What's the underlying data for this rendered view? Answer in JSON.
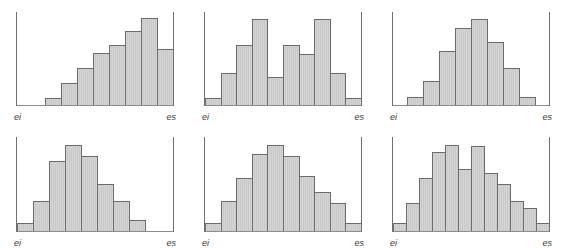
{
  "figure": {
    "type": "histogram-grid",
    "rows": 2,
    "columns": 3,
    "background_color": "#ffffff",
    "bar_fill_color": "#cfcfcf",
    "bar_border_color": "#6b6b6b",
    "axis_color": "#6f6f6f"
  },
  "axis_labels": {
    "left": "ei",
    "right": "es"
  },
  "chart_data": [
    {
      "type": "bar",
      "title": "",
      "subtitle": "",
      "xlabel": "",
      "ylabel": "",
      "panel": 1,
      "position": "top-left",
      "shape": "left-skewed increasing",
      "grid": false,
      "legend": "none",
      "xticks": [
        "ei",
        "es"
      ],
      "categories": [
        "1",
        "2",
        "3",
        "4",
        "5",
        "6",
        "7",
        "8",
        "9"
      ],
      "values": [
        0,
        0,
        8,
        24,
        40,
        56,
        64,
        80,
        94,
        60
      ],
      "ylim": [
        0,
        100
      ]
    },
    {
      "type": "bar",
      "title": "",
      "subtitle": "",
      "xlabel": "",
      "ylabel": "",
      "panel": 2,
      "position": "top-middle",
      "shape": "bimodal",
      "grid": false,
      "legend": "none",
      "xticks": [
        "ei",
        "es"
      ],
      "categories": [
        "1",
        "2",
        "3",
        "4",
        "5",
        "6",
        "7",
        "8",
        "9",
        "10"
      ],
      "values": [
        8,
        34,
        64,
        92,
        30,
        64,
        55,
        92,
        34,
        8
      ],
      "ylim": [
        0,
        100
      ]
    },
    {
      "type": "bar",
      "title": "",
      "subtitle": "",
      "xlabel": "",
      "ylabel": "",
      "panel": 3,
      "position": "top-right",
      "shape": "symmetric bell",
      "grid": false,
      "legend": "none",
      "xticks": [
        "ei",
        "es"
      ],
      "categories": [
        "1",
        "2",
        "3",
        "4",
        "5",
        "6",
        "7",
        "8"
      ],
      "values": [
        0,
        9,
        26,
        58,
        83,
        92,
        68,
        40,
        9,
        0
      ],
      "ylim": [
        0,
        100
      ]
    },
    {
      "type": "bar",
      "title": "",
      "subtitle": "",
      "xlabel": "",
      "ylabel": "",
      "panel": 4,
      "position": "bottom-left",
      "shape": "right-skewed",
      "grid": false,
      "legend": "none",
      "xticks": [
        "ei",
        "es"
      ],
      "categories": [
        "1",
        "2",
        "3",
        "4",
        "5",
        "6",
        "7",
        "8"
      ],
      "values": [
        8,
        32,
        74,
        92,
        80,
        50,
        32,
        12,
        0,
        0
      ],
      "ylim": [
        0,
        100
      ]
    },
    {
      "type": "bar",
      "title": "",
      "subtitle": "",
      "xlabel": "",
      "ylabel": "",
      "panel": 5,
      "position": "bottom-middle",
      "shape": "symmetric bell",
      "grid": false,
      "legend": "none",
      "xticks": [
        "ei",
        "es"
      ],
      "categories": [
        "1",
        "2",
        "3",
        "4",
        "5",
        "6",
        "7",
        "8",
        "9",
        "10"
      ],
      "values": [
        9,
        32,
        56,
        82,
        92,
        80,
        58,
        42,
        30,
        9
      ],
      "ylim": [
        0,
        100
      ]
    },
    {
      "type": "bar",
      "title": "",
      "subtitle": "",
      "xlabel": "",
      "ylabel": "",
      "panel": 6,
      "position": "bottom-right",
      "shape": "broad irregular",
      "grid": false,
      "legend": "none",
      "xticks": [
        "ei",
        "es"
      ],
      "categories": [
        "1",
        "2",
        "3",
        "4",
        "5",
        "6",
        "7",
        "8",
        "9",
        "10",
        "11",
        "12"
      ],
      "values": [
        8,
        30,
        56,
        84,
        92,
        66,
        90,
        62,
        50,
        32,
        24,
        8
      ],
      "ylim": [
        0,
        100
      ]
    }
  ]
}
